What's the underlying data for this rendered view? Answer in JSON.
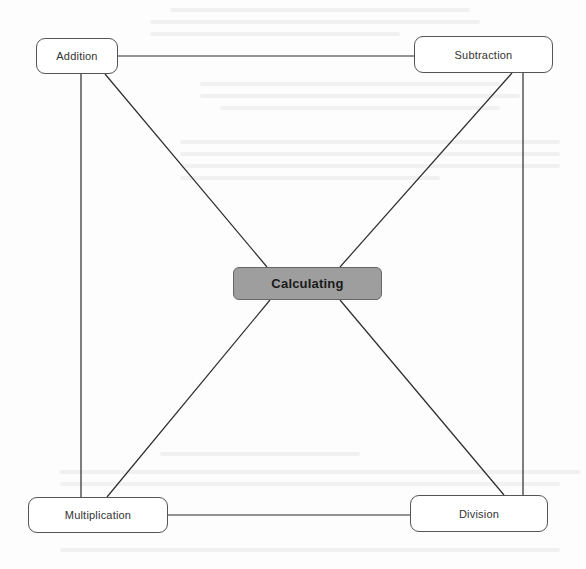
{
  "diagram": {
    "type": "hub-and-spoke",
    "center": {
      "id": "calculating",
      "label": "Calculating",
      "fill": "#9e9e9e"
    },
    "nodes": [
      {
        "id": "addition",
        "label": "Addition",
        "position": "top-left"
      },
      {
        "id": "subtraction",
        "label": "Subtraction",
        "position": "top-right"
      },
      {
        "id": "multiplication",
        "label": "Multiplication",
        "position": "bottom-left"
      },
      {
        "id": "division",
        "label": "Division",
        "position": "bottom-right"
      }
    ],
    "edges": [
      {
        "from": "addition",
        "to": "subtraction"
      },
      {
        "from": "addition",
        "to": "multiplication"
      },
      {
        "from": "subtraction",
        "to": "division"
      },
      {
        "from": "multiplication",
        "to": "division"
      },
      {
        "from": "addition",
        "to": "calculating"
      },
      {
        "from": "subtraction",
        "to": "calculating"
      },
      {
        "from": "multiplication",
        "to": "calculating"
      },
      {
        "from": "division",
        "to": "calculating"
      }
    ],
    "colors": {
      "line": "#2b2b2b",
      "node_border": "#555555",
      "center_fill": "#9e9e9e"
    }
  }
}
